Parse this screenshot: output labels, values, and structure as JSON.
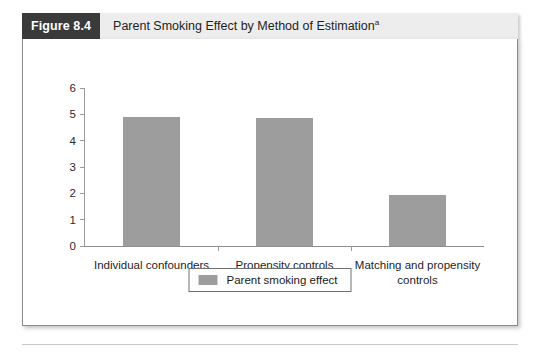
{
  "figure": {
    "number_label": "Figure 8.4",
    "title": "Parent Smoking Effect by Method of Estimation",
    "title_superscript": "a",
    "footnote": "a"
  },
  "legend": {
    "label": "Parent smoking effect",
    "swatch_name": "legend-color-swatch"
  },
  "colors": {
    "bar": "#9d9d9d",
    "header_bar": "#ededed",
    "number_badge": "#3a3a3a",
    "axis": "#9b9b9b",
    "panel_border": "#8a8a8a"
  },
  "chart_data": {
    "type": "bar",
    "title": "Parent Smoking Effect by Method of Estimation",
    "xlabel": "",
    "ylabel": "",
    "ylim": [
      0,
      6
    ],
    "yticks": [
      0,
      1,
      2,
      3,
      4,
      5,
      6
    ],
    "ytick_labels": [
      "0",
      "1",
      "2",
      "3",
      "4",
      "5",
      "6"
    ],
    "grid": false,
    "legend_position": "bottom-center",
    "categories": [
      "Individual confounders",
      "Propensity  controls",
      "Matching and propensity\ncontrols"
    ],
    "series": [
      {
        "name": "Parent smoking effect",
        "values": [
          4.9,
          4.85,
          1.95
        ]
      }
    ]
  }
}
